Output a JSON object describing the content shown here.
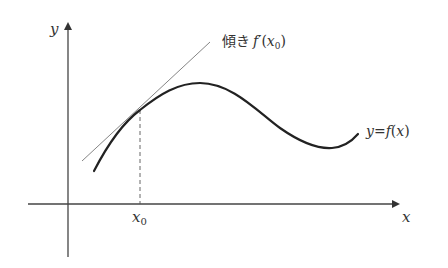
{
  "diagram": {
    "type": "tangent-line-illustration",
    "axes": {
      "x_label": "x",
      "y_label": "y"
    },
    "point_label": "x₀",
    "point_label_base": "x",
    "point_label_sub": "0",
    "tangent_label": {
      "prefix": "傾き",
      "func": "f′",
      "arg_open": "(",
      "arg_var": "x",
      "arg_sub": "0",
      "arg_close": ")"
    },
    "curve_label": {
      "lhs": "y",
      "eq": "=",
      "func": "f",
      "open": "(",
      "var": "x",
      "close": ")"
    },
    "colors": {
      "curve": "#222222",
      "tangent": "#777777",
      "axes": "#444444",
      "dashed": "#555555"
    }
  }
}
